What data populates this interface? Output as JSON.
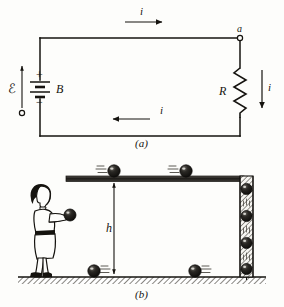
{
  "figure": {
    "background_color": "#fdfdfb",
    "ink_color": "#15130f"
  },
  "panel_a": {
    "caption": "(a)",
    "description": "Simple circuit: battery B with emf drives current i through resistor R",
    "labels": {
      "emf": "ℰ",
      "battery": "B",
      "plus": "+",
      "minus": "−",
      "resistor": "R",
      "node": "a",
      "current_top": "i",
      "current_bottom": "i",
      "current_right": "i"
    },
    "elements": [
      {
        "name": "top-wire",
        "current_direction": "right"
      },
      {
        "name": "bottom-wire",
        "current_direction": "left"
      },
      {
        "name": "right-wire",
        "current_direction": "down"
      },
      {
        "name": "battery",
        "symbol": "two-cell",
        "polarity_top": "+",
        "polarity_bottom": "−"
      },
      {
        "name": "resistor",
        "symbol": "zigzag",
        "zigzag_peaks": 6
      },
      {
        "name": "terminal-node-a",
        "symbol": "open-circle"
      },
      {
        "name": "terminal-node-lower",
        "symbol": "open-circle"
      },
      {
        "name": "emf-arrow",
        "direction": "up"
      }
    ]
  },
  "panel_b": {
    "caption": "(b)",
    "description": "Person lifts balls to an elevated track; balls roll right, fall down a chute, and return left along the ground",
    "labels": {
      "height": "h"
    },
    "elements": [
      {
        "name": "person",
        "action": "lifting-ball",
        "facing": "right"
      },
      {
        "name": "elevated-track",
        "orientation": "horizontal",
        "ball_count": 2,
        "ball_motion": "right"
      },
      {
        "name": "vertical-chute",
        "orientation": "vertical",
        "ball_count": 4,
        "ball_motion": "down"
      },
      {
        "name": "ground",
        "hatched": true,
        "ball_count": 2,
        "ball_motion": "left"
      },
      {
        "name": "height-arrow",
        "style": "double-headed",
        "label": "h"
      }
    ]
  }
}
